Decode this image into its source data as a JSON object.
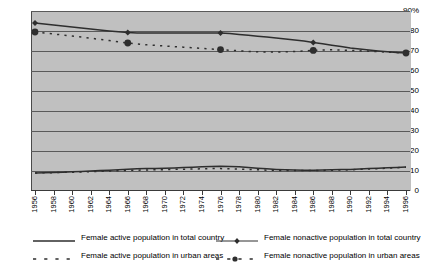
{
  "chart_data": {
    "type": "line",
    "title": "",
    "subtitle": "",
    "xlabel": "",
    "ylabel": "",
    "ylim": [
      0,
      90
    ],
    "ytick_labels": [
      "90%",
      "80",
      "70",
      "60",
      "50",
      "40",
      "30",
      "20",
      "10",
      "0"
    ],
    "ytick_values": [
      90,
      80,
      70,
      60,
      50,
      40,
      30,
      20,
      10,
      0
    ],
    "grid": "horizontal",
    "legend_position": "bottom",
    "x": [
      1956,
      1957,
      1958,
      1959,
      1960,
      1961,
      1962,
      1963,
      1964,
      1965,
      1966,
      1967,
      1968,
      1969,
      1970,
      1971,
      1972,
      1973,
      1974,
      1975,
      1976,
      1977,
      1978,
      1979,
      1980,
      1981,
      1982,
      1983,
      1984,
      1985,
      1986,
      1987,
      1988,
      1989,
      1990,
      1991,
      1992,
      1993,
      1994,
      1995,
      1996
    ],
    "xtick_labels": [
      "1956",
      "1958",
      "1960",
      "1962",
      "1964",
      "1966",
      "1968",
      "1970",
      "1972",
      "1974",
      "1976",
      "1978",
      "1980",
      "1982",
      "1984",
      "1986",
      "1988",
      "1990",
      "1992",
      "1994",
      "1996"
    ],
    "series": [
      {
        "name": "Female active population in total country",
        "style": "solid",
        "marker": "none",
        "color": "#2e2e2e",
        "values": [
          9.0,
          9.1,
          9.2,
          9.4,
          9.6,
          9.8,
          10.0,
          10.2,
          10.4,
          10.6,
          10.9,
          11.1,
          11.2,
          11.3,
          11.4,
          11.5,
          11.7,
          11.9,
          12.1,
          12.3,
          12.4,
          12.3,
          12.1,
          11.8,
          11.4,
          11.1,
          10.8,
          10.6,
          10.5,
          10.4,
          10.4,
          10.5,
          10.6,
          10.7,
          10.8,
          11.0,
          11.2,
          11.4,
          11.6,
          11.8,
          12.0
        ]
      },
      {
        "name": "Female nonactive population in total country",
        "style": "solid",
        "marker": "diamond",
        "color": "#2e2e2e",
        "values": [
          84.0,
          83.5,
          83.0,
          82.5,
          82.0,
          81.5,
          81.0,
          80.5,
          80.0,
          79.6,
          79.2,
          79.0,
          79.0,
          79.0,
          79.0,
          79.0,
          79.0,
          79.0,
          79.0,
          79.0,
          79.0,
          78.7,
          78.3,
          77.9,
          77.4,
          77.0,
          76.5,
          76.0,
          75.5,
          75.0,
          74.3,
          73.6,
          72.9,
          72.2,
          71.5,
          71.0,
          70.5,
          70.0,
          69.6,
          69.2,
          69.0
        ]
      },
      {
        "name": "Female active population in urban areas",
        "style": "dashed",
        "marker": "none",
        "color": "#2e2e2e",
        "values": [
          9.0,
          9.1,
          9.2,
          9.3,
          9.4,
          9.5,
          9.7,
          9.8,
          10.0,
          10.1,
          10.3,
          10.4,
          10.5,
          10.6,
          10.7,
          10.8,
          10.9,
          11.0,
          11.1,
          11.2,
          11.2,
          11.1,
          11.0,
          10.8,
          10.6,
          10.4,
          10.3,
          10.2,
          10.2,
          10.2,
          10.2,
          10.3,
          10.4,
          10.5,
          10.6,
          10.8,
          11.0,
          11.2,
          11.4,
          11.6,
          11.9
        ]
      },
      {
        "name": "Female nonactive population in urban areas",
        "style": "dashed",
        "marker": "circle",
        "color": "#2e2e2e",
        "values": [
          79.5,
          79.0,
          78.5,
          78.0,
          77.5,
          77.0,
          76.4,
          75.8,
          75.2,
          74.6,
          74.0,
          73.5,
          73.1,
          72.8,
          72.5,
          72.2,
          71.9,
          71.6,
          71.3,
          71.0,
          70.7,
          70.4,
          70.1,
          69.8,
          69.6,
          69.5,
          69.5,
          69.6,
          69.8,
          70.0,
          70.3,
          70.5,
          70.6,
          70.5,
          70.3,
          70.1,
          69.9,
          69.7,
          69.4,
          69.2,
          69.0
        ]
      }
    ],
    "markers_every": 10
  },
  "legend": {
    "items": [
      {
        "label": "Female active population in total country"
      },
      {
        "label": "Female nonactive population in total country"
      },
      {
        "label": "Female active population in urban areas"
      },
      {
        "label": "Female nonactive population in urban areas"
      }
    ]
  },
  "colors": {
    "plot_background": "#c0c0c0",
    "gridline": "#5a5a5a",
    "series_line": "#2e2e2e",
    "axis": "#3a3a3a",
    "page_background": "#ffffff"
  }
}
